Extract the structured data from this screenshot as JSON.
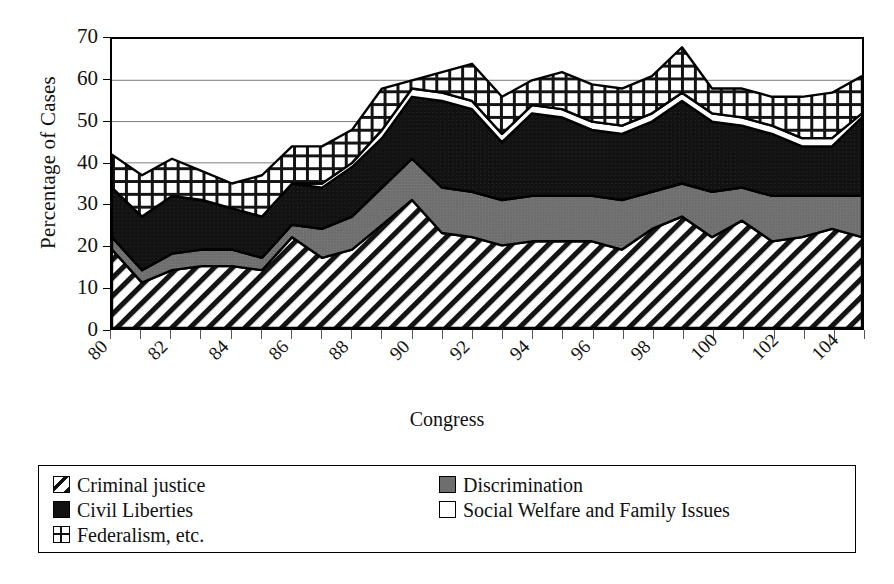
{
  "chart_data": {
    "type": "area",
    "stacked": true,
    "title": "",
    "xlabel": "Congress",
    "ylabel": "Percentage of Cases",
    "ylim": [
      0,
      70
    ],
    "ytick_step": 10,
    "ytick_labels": [
      "0",
      "10",
      "20",
      "30",
      "40",
      "50",
      "60",
      "70"
    ],
    "grid": "horizontal",
    "legend_position": "bottom",
    "x": [
      80,
      81,
      82,
      83,
      84,
      85,
      86,
      87,
      88,
      89,
      90,
      91,
      92,
      93,
      94,
      95,
      96,
      97,
      98,
      99,
      100,
      101,
      102,
      103,
      104,
      105
    ],
    "xtick_labels": [
      "80",
      "82",
      "84",
      "86",
      "88",
      "90",
      "92",
      "94",
      "96",
      "98",
      "100",
      "102",
      "104"
    ],
    "xtick_label_rotation": -45,
    "series": [
      {
        "name": "Criminal justice",
        "pattern": "diagonal-hatch",
        "color": "#ffffff",
        "values": [
          19,
          11,
          14,
          15,
          15,
          14,
          22,
          17,
          19,
          25,
          31,
          23,
          22,
          20,
          21,
          21,
          21,
          19,
          24,
          27,
          22,
          26,
          21,
          22,
          24,
          22
        ]
      },
      {
        "name": "Discrimination",
        "pattern": "solid-gray",
        "color": "#6e6e6e",
        "values": [
          3,
          3,
          4,
          4,
          4,
          3,
          3,
          7,
          8,
          9,
          10,
          11,
          11,
          11,
          11,
          11,
          11,
          12,
          9,
          8,
          11,
          8,
          11,
          10,
          8,
          10
        ]
      },
      {
        "name": "Civil Liberties",
        "pattern": "solid-black",
        "color": "#121212",
        "values": [
          12,
          13,
          14,
          12,
          10,
          10,
          10,
          10,
          12,
          12,
          15,
          21,
          20,
          14,
          20,
          19,
          16,
          16,
          17,
          20,
          17,
          15,
          15,
          12,
          12,
          19
        ]
      },
      {
        "name": "Social Welfare and Family Issues",
        "pattern": "open-white",
        "color": "#ffffff",
        "values": [
          0,
          0,
          0,
          0,
          0,
          0,
          0,
          1,
          1,
          2,
          2,
          2,
          2,
          2,
          2,
          2,
          2,
          2,
          2,
          2,
          2,
          2,
          2,
          2,
          2,
          1
        ]
      },
      {
        "name": "Federalism, etc.",
        "pattern": "cross-hatch",
        "color": "#ffffff",
        "values": [
          8,
          10,
          9,
          7,
          6,
          10,
          9,
          9,
          8,
          10,
          2,
          5,
          9,
          9,
          6,
          9,
          9,
          9,
          9,
          11,
          6,
          7,
          7,
          10,
          11,
          9
        ]
      }
    ]
  },
  "axes": {
    "ylabel": "Percentage of Cases",
    "xlabel": "Congress"
  },
  "legend": {
    "column_a": [
      {
        "label": "Criminal justice",
        "swatch": "diagonal-hatch-swatch"
      },
      {
        "label": "Civil Liberties",
        "swatch": "solid-black-swatch"
      },
      {
        "label": "Federalism, etc.",
        "swatch": "cross-hatch-swatch"
      }
    ],
    "column_b": [
      {
        "label": "Discrimination",
        "swatch": "solid-gray-swatch"
      },
      {
        "label": "Social Welfare and Family Issues",
        "swatch": "open-white-swatch"
      }
    ]
  },
  "colors": {
    "gray": "#6e6e6e",
    "black": "#121212",
    "white": "#ffffff",
    "frame": "#000000",
    "gridline": "#7a7a7a"
  }
}
